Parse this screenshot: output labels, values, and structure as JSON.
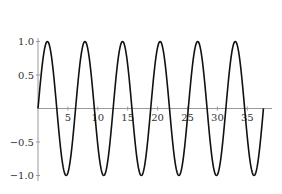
{
  "chart_data": {
    "type": "line",
    "title": "",
    "xlabel": "",
    "ylabel": "",
    "function": "sin(x)",
    "x_range": [
      0,
      37.7
    ],
    "xlim": [
      0,
      38
    ],
    "ylim": [
      -1.05,
      1.05
    ],
    "grid": false,
    "legend": null,
    "x_ticks": [
      5,
      10,
      15,
      20,
      25,
      30,
      35
    ],
    "x_tick_labels": [
      "5",
      "10",
      "15",
      "20",
      "25",
      "30",
      "35"
    ],
    "y_ticks": [
      1.0,
      0.5,
      -0.5,
      -1.0
    ],
    "y_tick_labels": [
      "1.0",
      "0.5",
      "−0.5",
      "−1.0"
    ],
    "series": [
      {
        "name": "sin(x)",
        "color": "#111111",
        "peaks_x": [
          1.57,
          7.85,
          14.14,
          20.42,
          26.7,
          32.99
        ],
        "troughs_x": [
          4.71,
          10.99,
          17.28,
          23.56,
          29.85,
          36.13
        ],
        "amplitude": 1.0
      }
    ],
    "colors": {
      "curve": "#111111",
      "axis": "#999999"
    }
  }
}
